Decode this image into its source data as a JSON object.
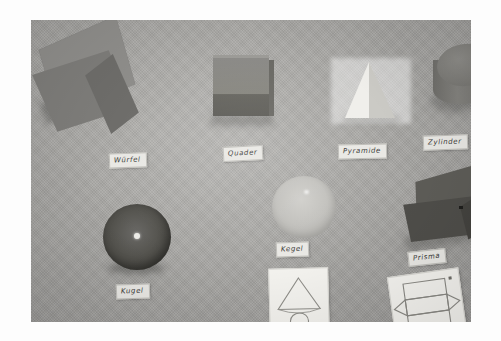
{
  "scene": {
    "title": "Geometrische Körper",
    "medium": "photograph",
    "board_color": "#a9a9a7",
    "frame_color": "#ffffff"
  },
  "objects": [
    {
      "id": "wuerfel",
      "label": "Würfel",
      "shape": "cube",
      "color": "#7e7d7a",
      "row": "top",
      "position": 1
    },
    {
      "id": "quader",
      "label": "Quader",
      "shape": "cuboid",
      "color": "#87867f",
      "row": "top",
      "position": 2
    },
    {
      "id": "pyramide",
      "label": "Pyramide",
      "shape": "pyramid",
      "color": "#f0efeb",
      "row": "top",
      "position": 3
    },
    {
      "id": "zylinder",
      "label": "Zylinder",
      "shape": "cylinder",
      "color": "#7c7b77",
      "row": "top",
      "position": 4
    },
    {
      "id": "kugel",
      "label": "Kugel",
      "shape": "sphere",
      "color": "#4d4c48",
      "row": "bottom",
      "position": 1
    },
    {
      "id": "kegel",
      "label": "Kegel",
      "shape": "sphere-light",
      "color": "#c2c1bd",
      "row": "bottom",
      "position": 2
    },
    {
      "id": "prisma",
      "label": "Prisma",
      "shape": "triangular-prism",
      "color": "#4f4e4a",
      "row": "bottom",
      "position": 3
    }
  ],
  "cards": [
    {
      "id": "card-kegel",
      "drawing": "cone-net",
      "description": "cone net: triangle over circle"
    },
    {
      "id": "card-prisma",
      "drawing": "prism-net",
      "description": "prism net: rectangles with triangular ends"
    }
  ]
}
